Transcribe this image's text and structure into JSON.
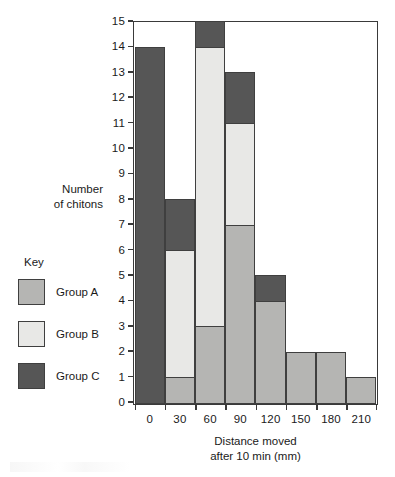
{
  "chart_data": {
    "type": "bar",
    "subtype": "stacked-histogram",
    "title": "",
    "xlabel": "Distance moved after 10 min (mm)",
    "xlabel_line1": "Distance moved",
    "xlabel_line2": "after 10 min (mm)",
    "ylabel": "Number of chitons",
    "ylabel_line1": "Number",
    "ylabel_line2": "of chitons",
    "categories": [
      "0",
      "30",
      "60",
      "90",
      "120",
      "150",
      "180",
      "210"
    ],
    "bin_width": 30,
    "xlim": [
      0,
      240
    ],
    "ylim": [
      0,
      15
    ],
    "ytick_step": 1,
    "grid": false,
    "legend_position": "left",
    "legend_title": "Key",
    "yticks": [
      "15",
      "14",
      "13",
      "12",
      "11",
      "10",
      "9",
      "8",
      "7",
      "6",
      "5",
      "4",
      "3",
      "2",
      "1",
      "0"
    ],
    "series": [
      {
        "name": "Group A",
        "color": "#b5b5b3",
        "values": [
          0,
          1,
          3,
          7,
          4,
          2,
          2,
          1
        ]
      },
      {
        "name": "Group B",
        "color": "#e8e8e6",
        "values": [
          0,
          5,
          11,
          4,
          0,
          0,
          0,
          0
        ]
      },
      {
        "name": "Group C",
        "color": "#565656",
        "values": [
          14,
          2,
          1,
          2,
          1,
          0,
          0,
          0
        ]
      }
    ],
    "totals": [
      14,
      8,
      15,
      13,
      5,
      2,
      2,
      1
    ],
    "stack_order": [
      "Group A",
      "Group B",
      "Group C"
    ],
    "axis_color": "#3a3a3a",
    "bar_outline_color": "#3f3f3f"
  },
  "legend": {
    "title": "Key",
    "items": [
      {
        "label": "Group A",
        "color": "#b5b5b3"
      },
      {
        "label": "Group B",
        "color": "#e8e8e6"
      },
      {
        "label": "Group C",
        "color": "#565656"
      }
    ]
  }
}
